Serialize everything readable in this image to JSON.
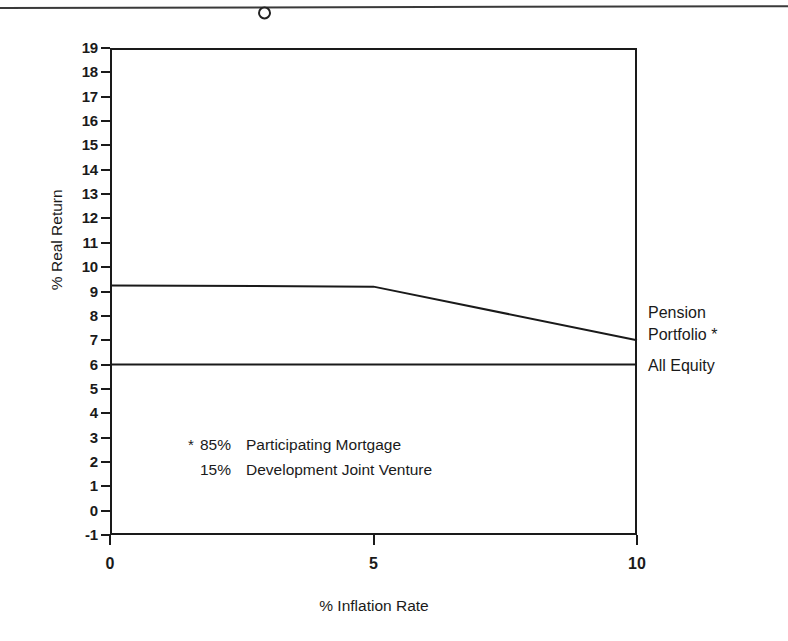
{
  "chart_data": {
    "type": "line",
    "title": "",
    "xlabel": "% Inflation Rate",
    "ylabel": "% Real Return",
    "xlim": [
      0,
      10
    ],
    "ylim": [
      -1,
      19
    ],
    "grid": false,
    "legend_position": "right-of-plot-inline",
    "x_ticks": [
      {
        "value": 0,
        "label": "0"
      },
      {
        "value": 5,
        "label": "5"
      },
      {
        "value": 10,
        "label": "10"
      }
    ],
    "y_ticks": [
      {
        "value": 19,
        "label": "19"
      },
      {
        "value": 18,
        "label": "18"
      },
      {
        "value": 17,
        "label": "17"
      },
      {
        "value": 16,
        "label": "16"
      },
      {
        "value": 15,
        "label": "15"
      },
      {
        "value": 14,
        "label": "14"
      },
      {
        "value": 13,
        "label": "13"
      },
      {
        "value": 12,
        "label": "12"
      },
      {
        "value": 11,
        "label": "11"
      },
      {
        "value": 10,
        "label": "10"
      },
      {
        "value": 9,
        "label": "9"
      },
      {
        "value": 8,
        "label": "8"
      },
      {
        "value": 7,
        "label": "7"
      },
      {
        "value": 6,
        "label": "6"
      },
      {
        "value": 5,
        "label": "5"
      },
      {
        "value": 4,
        "label": "4"
      },
      {
        "value": 3,
        "label": "3"
      },
      {
        "value": 2,
        "label": "2"
      },
      {
        "value": 1,
        "label": "1"
      },
      {
        "value": 0,
        "label": "0"
      },
      {
        "value": -1,
        "label": "-1"
      }
    ],
    "series": [
      {
        "name": "Pension Portfolio *",
        "label_lines": [
          "Pension",
          "Portfolio *"
        ],
        "x": [
          0,
          5,
          10
        ],
        "values": [
          9.25,
          9.2,
          7.0
        ],
        "color": "#1a1a1a"
      },
      {
        "name": "All Equity",
        "label_lines": [
          "All Equity"
        ],
        "x": [
          0,
          10
        ],
        "values": [
          6.0,
          6.0
        ],
        "color": "#1a1a1a"
      }
    ],
    "annotations": [
      {
        "star": "*",
        "pct": "85%",
        "text": "Participating Mortgage"
      },
      {
        "star": "",
        "pct": "15%",
        "text": "Development Joint Venture"
      }
    ]
  },
  "series_labels": {
    "pension_line1": "Pension",
    "pension_line2": "Portfolio *",
    "all_equity": "All Equity"
  },
  "axes": {
    "x_title": "% Inflation Rate",
    "y_title": "% Real Return"
  },
  "footnote": {
    "line1_star": "*",
    "line1_pct": "85%",
    "line1_text": "Participating Mortgage",
    "line2_pct": "15%",
    "line2_text": "Development Joint Venture"
  },
  "colors": {
    "ink": "#1a1a1a",
    "paper": "#ffffff"
  }
}
